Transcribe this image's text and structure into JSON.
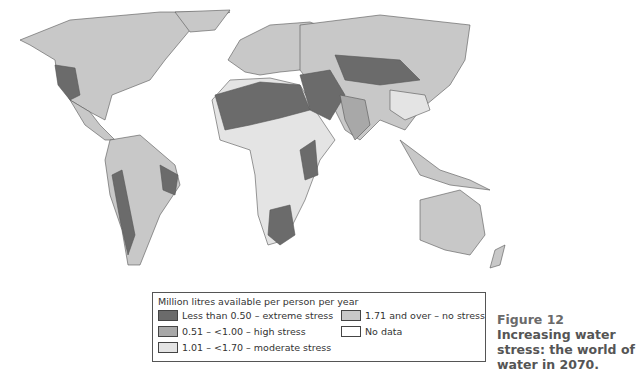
{
  "map": {
    "subject": "World water availability per person, projected 2070",
    "projection": "world",
    "classes": {
      "extreme": "#6b6b6b",
      "high": "#a8a8a8",
      "moderate": "#e4e4e4",
      "none": "#c8c8c8",
      "no_data": "#ffffff"
    },
    "border_color": "#555555"
  },
  "legend": {
    "title": "Million litres available per person per year",
    "items": [
      {
        "key": "extreme",
        "label": "Less than 0.50 – extreme stress",
        "color": "#6b6b6b"
      },
      {
        "key": "high",
        "label": "0.51 – <1.00 – high stress",
        "color": "#a8a8a8"
      },
      {
        "key": "moderate",
        "label": "1.01 – <1.70 – moderate stress",
        "color": "#e4e4e4"
      },
      {
        "key": "none",
        "label": "1.71 and over – no stress",
        "color": "#c8c8c8"
      },
      {
        "key": "no_data",
        "label": "No data",
        "color": "#ffffff"
      }
    ]
  },
  "caption": {
    "figure_label": "Figure 12",
    "text": "Increasing water stress: the world of water in 2070."
  }
}
